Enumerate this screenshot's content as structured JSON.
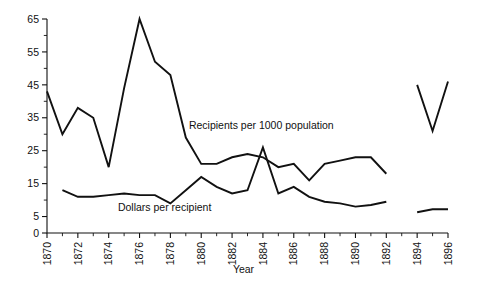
{
  "chart_data": {
    "type": "line",
    "title": "",
    "subtitle": "",
    "xlabel": "Year",
    "ylabel": "",
    "xlim": [
      1870,
      1896
    ],
    "ylim": [
      0,
      65
    ],
    "grid": false,
    "legend_position": "inline-annotation",
    "y_ticks": [
      0,
      5,
      15,
      25,
      35,
      45,
      55,
      65
    ],
    "y_tick_labels": [
      "0",
      "5",
      "15",
      "25",
      "35",
      "45",
      "55",
      "65"
    ],
    "y_minor_ticks": [
      10,
      20,
      30,
      40,
      50,
      60
    ],
    "x_ticks": [
      1870,
      1872,
      1874,
      1876,
      1878,
      1880,
      1882,
      1884,
      1886,
      1888,
      1890,
      1892,
      1894,
      1896
    ],
    "x_tick_labels": [
      "1870",
      "1872",
      "1874",
      "1876",
      "1878",
      "1880",
      "1882",
      "1884",
      "1886",
      "1888",
      "1890",
      "1892",
      "1894",
      "1896"
    ],
    "x_minor_ticks": [
      1871,
      1873,
      1875,
      1877,
      1879,
      1881,
      1883,
      1885,
      1887,
      1889,
      1891,
      1893,
      1895
    ],
    "series": [
      {
        "name": "Recipients per 1000 population",
        "label_text": "Recipients per 1000 population",
        "label_x": 1879.2,
        "label_y": 31.5,
        "segments": [
          {
            "x": [
              1870,
              1871,
              1872,
              1873,
              1874,
              1875,
              1876,
              1877,
              1878,
              1879,
              1880,
              1881,
              1882,
              1883,
              1884,
              1885,
              1886,
              1887,
              1888,
              1889,
              1890,
              1891,
              1892
            ],
            "y": [
              43,
              30,
              38,
              35,
              20,
              44,
              65,
              52,
              48,
              29,
              21,
              21,
              23,
              24,
              23,
              20,
              21,
              16,
              21,
              22,
              23,
              23,
              18
            ]
          },
          {
            "x": [
              1894,
              1895,
              1896
            ],
            "y": [
              45,
              31,
              46
            ]
          }
        ]
      },
      {
        "name": "Dollars per recipient",
        "label_text": "Dollars per recipient",
        "label_x": 1874.6,
        "label_y": 6.6,
        "segments": [
          {
            "x": [
              1871,
              1872,
              1873,
              1874,
              1875,
              1876,
              1877,
              1878,
              1879,
              1880,
              1881,
              1882,
              1883,
              1884,
              1885,
              1886,
              1887,
              1888,
              1889,
              1890,
              1891,
              1892
            ],
            "y": [
              13,
              11,
              11,
              11.5,
              12,
              11.5,
              11.5,
              9,
              13,
              17,
              14,
              12,
              13,
              26,
              12,
              14,
              11,
              9.5,
              9,
              8,
              8.5,
              9.5
            ]
          },
          {
            "x": [
              1894,
              1895,
              1896
            ],
            "y": [
              6.3,
              7.2,
              7.2
            ]
          }
        ]
      }
    ]
  }
}
